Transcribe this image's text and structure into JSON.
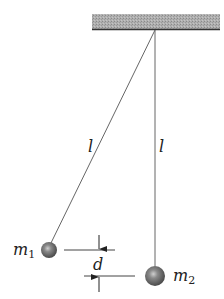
{
  "diagram": {
    "type": "double-pendulum-offset",
    "ceiling": {
      "color": "#a8a8a8",
      "edge_color": "#3a3a3a"
    },
    "strings": [
      {
        "id": "left",
        "label": "l"
      },
      {
        "id": "right",
        "label": "l"
      }
    ],
    "masses": [
      {
        "id": "m1",
        "symbol": "m",
        "subscript": "1"
      },
      {
        "id": "m2",
        "symbol": "m",
        "subscript": "2"
      }
    ],
    "separation": {
      "label": "d"
    },
    "colors": {
      "line": "#555555",
      "ball": "#6a6a6a",
      "ball_highlight": "#c8c8c8",
      "text": "#222222"
    }
  }
}
